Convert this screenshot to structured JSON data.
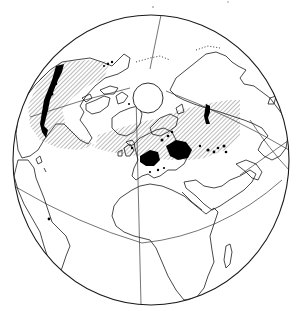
{
  "map": {
    "projection": "orthographic-north-polar-oblique",
    "colors": {
      "land_outline": "#1a1a1a",
      "hatch": "#555555",
      "dots": "#000000",
      "background": "#ffffff"
    },
    "legend": [],
    "layers": [
      {
        "name": "hatched-range",
        "description": "Hatched band across the northern temperate/boreal zone of North America and Eurasia"
      },
      {
        "name": "dot-occurrences",
        "description": "Dense black dot clusters in western North America, Europe and western Russia"
      },
      {
        "name": "north-pole-circle",
        "description": "Blank circle at the North Pole"
      }
    ],
    "regions_marked": [
      "Alaska / Yukon",
      "Western Canada / Rocky Mountains",
      "Great Britain",
      "Scandinavia",
      "Central Europe",
      "Western Russia",
      "Urals",
      "West Siberia",
      "Gulf of Guinea (single point)"
    ]
  }
}
